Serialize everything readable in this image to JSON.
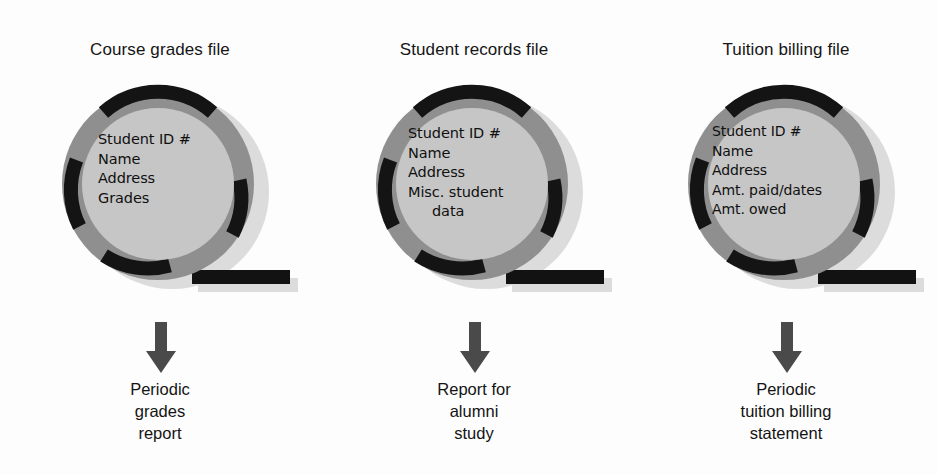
{
  "diagram": {
    "background_color": "#fdfdfd",
    "colors": {
      "disk_outer_ring": "#8f8f8f",
      "disk_inner": "#c6c6c6",
      "disk_arc": "#141414",
      "disk_shadow": "#d6d6d6",
      "tail_bar": "#121212",
      "arrow": "#4a4a4a",
      "text": "#141414"
    }
  },
  "columns": [
    {
      "title": "Course grades file",
      "disk_icon": "disk-platter-icon",
      "fields": [
        {
          "text": "Student ID #",
          "indent": false
        },
        {
          "text": "Name",
          "indent": false
        },
        {
          "text": "Address",
          "indent": false
        },
        {
          "text": "Grades",
          "indent": false
        }
      ],
      "arrow_icon": "down-arrow-icon",
      "output": [
        "Periodic",
        "grades",
        "report"
      ]
    },
    {
      "title": "Student records file",
      "disk_icon": "disk-platter-icon",
      "fields": [
        {
          "text": "Student ID #",
          "indent": false
        },
        {
          "text": "Name",
          "indent": false
        },
        {
          "text": "Address",
          "indent": false
        },
        {
          "text": "Misc. student",
          "indent": false
        },
        {
          "text": "data",
          "indent": true
        }
      ],
      "arrow_icon": "down-arrow-icon",
      "output": [
        "Report for",
        "alumni",
        "study"
      ]
    },
    {
      "title": "Tuition billing file",
      "disk_icon": "disk-platter-icon",
      "fields": [
        {
          "text": "Student ID #",
          "indent": false
        },
        {
          "text": "Name",
          "indent": false
        },
        {
          "text": "Address",
          "indent": false
        },
        {
          "text": "Amt. paid/dates",
          "indent": false
        },
        {
          "text": "Amt. owed",
          "indent": false
        }
      ],
      "arrow_icon": "down-arrow-icon",
      "output": [
        "Periodic",
        "tuition billing",
        "statement"
      ]
    }
  ]
}
